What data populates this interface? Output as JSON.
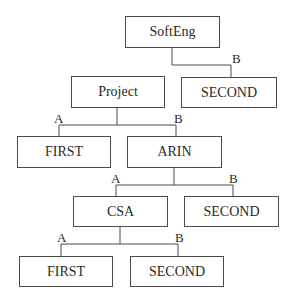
{
  "diagram": {
    "type": "decision-tree",
    "nodes": [
      {
        "id": "softeng",
        "label": "SoftEng"
      },
      {
        "id": "second_1",
        "label": "SECOND"
      },
      {
        "id": "project",
        "label": "Project"
      },
      {
        "id": "first_1",
        "label": "FIRST"
      },
      {
        "id": "arin",
        "label": "ARIN"
      },
      {
        "id": "csa",
        "label": "CSA"
      },
      {
        "id": "second_2",
        "label": "SECOND"
      },
      {
        "id": "first_2",
        "label": "FIRST"
      },
      {
        "id": "second_3",
        "label": "SECOND"
      }
    ],
    "edges": [
      {
        "from": "softeng",
        "to": "second_1",
        "label": "B"
      },
      {
        "from": "project",
        "to": "first_1",
        "label": "A"
      },
      {
        "from": "project",
        "to": "arin",
        "label": "B"
      },
      {
        "from": "arin",
        "to": "csa",
        "label": "A"
      },
      {
        "from": "arin",
        "to": "second_2",
        "label": "B"
      },
      {
        "from": "csa",
        "to": "first_2",
        "label": "A"
      },
      {
        "from": "csa",
        "to": "second_3",
        "label": "B"
      }
    ]
  }
}
